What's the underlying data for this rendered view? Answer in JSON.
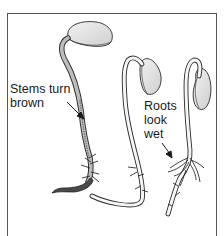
{
  "figure": {
    "labels": [
      {
        "id": "stems",
        "text": "Stems turn\nbrown"
      },
      {
        "id": "roots",
        "text": "Roots\nlook\nwet"
      }
    ],
    "seedlings": [
      {
        "name": "left-seedling",
        "condition": "stem browned, dark curled root"
      },
      {
        "name": "middle-seedling",
        "condition": "long pale root"
      },
      {
        "name": "right-seedling",
        "condition": "roots look wet"
      }
    ],
    "colors": {
      "ink": "#2a2a2a",
      "seed_fill": "#e6e6e6",
      "stem_fill": "#f4f4f4",
      "brown_stem": "#8a8a8a",
      "background": "#ffffff"
    }
  }
}
